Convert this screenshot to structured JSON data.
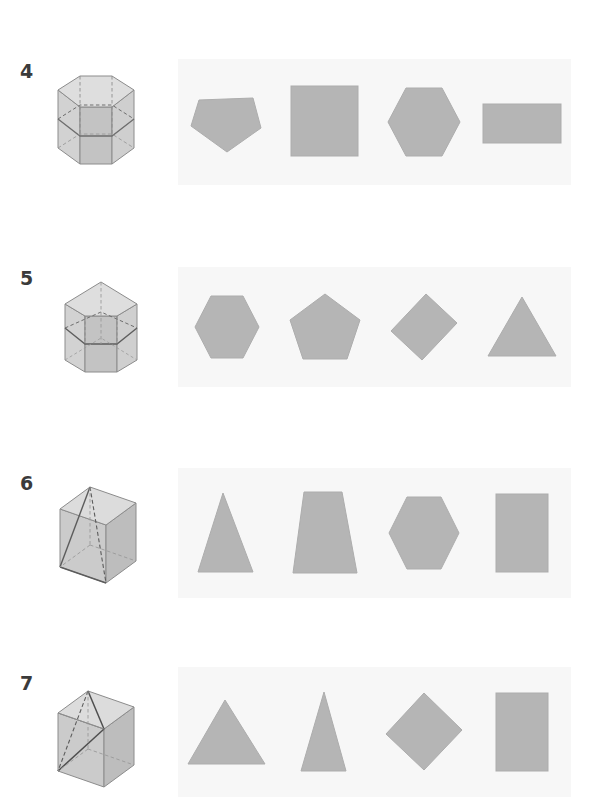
{
  "page": {
    "background_color": "#ffffff",
    "panel_color": "#f7f7f7",
    "shape_fill": "#b5b5b5",
    "shape_stroke": "#a8a8a8",
    "number_color": "#3b3b3b"
  },
  "questions": [
    {
      "number": "4",
      "solid": {
        "name": "hexagonal-prism-with-horizontal-cross-section",
        "label": "hexagonal prism",
        "cut": "horizontal plane"
      },
      "options": [
        {
          "key": "a",
          "label": "pentagon",
          "shape": "pentagon-down"
        },
        {
          "key": "b",
          "label": "square",
          "shape": "square"
        },
        {
          "key": "c",
          "label": "hexagon",
          "shape": "hexagon"
        },
        {
          "key": "d",
          "label": "rectangle",
          "shape": "rectangle-landscape"
        }
      ]
    },
    {
      "number": "5",
      "solid": {
        "name": "pentagonal-prism-with-cross-section",
        "label": "pentagonal prism",
        "cut": "pentagon plane"
      },
      "options": [
        {
          "key": "a",
          "label": "hexagon",
          "shape": "hexagon"
        },
        {
          "key": "b",
          "label": "pentagon",
          "shape": "pentagon-up"
        },
        {
          "key": "c",
          "label": "rhombus",
          "shape": "diamond"
        },
        {
          "key": "d",
          "label": "triangle",
          "shape": "triangle"
        }
      ]
    },
    {
      "number": "6",
      "solid": {
        "name": "cube-with-diagonal-cross-section",
        "label": "cube",
        "cut": "diagonal plane"
      },
      "options": [
        {
          "key": "a",
          "label": "triangle",
          "shape": "triangle"
        },
        {
          "key": "b",
          "label": "trapezoid",
          "shape": "trapezoid"
        },
        {
          "key": "c",
          "label": "hexagon",
          "shape": "hexagon"
        },
        {
          "key": "d",
          "label": "rectangle",
          "shape": "rectangle-portrait"
        }
      ]
    },
    {
      "number": "7",
      "solid": {
        "name": "cube-with-triangular-cross-section",
        "label": "cube",
        "cut": "triangular plane"
      },
      "options": [
        {
          "key": "a",
          "label": "triangle",
          "shape": "triangle-wide"
        },
        {
          "key": "b",
          "label": "narrow triangle",
          "shape": "triangle-narrow"
        },
        {
          "key": "c",
          "label": "rhombus",
          "shape": "diamond"
        },
        {
          "key": "d",
          "label": "rectangle",
          "shape": "rectangle-portrait"
        }
      ]
    }
  ]
}
